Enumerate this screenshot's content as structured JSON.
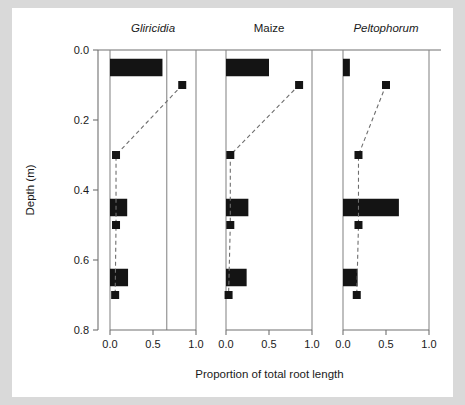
{
  "figure": {
    "background_color": "#d9d9d9",
    "canvas_color": "#ffffff",
    "axis_color": "#707070",
    "data_color": "#141414"
  },
  "axes": {
    "y_title": "Depth (m)",
    "x_title": "Proportion of total root length",
    "y_ticks": [
      "0.0",
      "0.2",
      "0.4",
      "0.6",
      "0.8"
    ],
    "y_tick_values": [
      0.0,
      0.2,
      0.4,
      0.6,
      0.8
    ],
    "x_ticks": [
      "0.0",
      "0.5",
      "1.0"
    ],
    "x_tick_values": [
      0.0,
      0.5,
      1.0
    ],
    "y_limits": [
      0.0,
      0.8
    ],
    "x_limits": [
      0.0,
      1.0
    ],
    "y_inverted": true
  },
  "chart_data": {
    "type": "bar",
    "title": "",
    "subtitle": "",
    "xlabel": "Proportion of total root length",
    "ylabel": "Depth (m)",
    "xlim": [
      0.0,
      1.0
    ],
    "ylim": [
      0.0,
      0.8
    ],
    "y_inverted": true,
    "grid": false,
    "legend": "none",
    "orientation": "horizontal",
    "panel_layout": "1x3",
    "categories": [
      0.05,
      0.1,
      0.3,
      0.45,
      0.5,
      0.65,
      0.7
    ],
    "panels": [
      {
        "title": "Gliricidia",
        "title_style": "italic",
        "bars": [
          {
            "depth": 0.05,
            "value": 0.61,
            "height_m": 0.05
          },
          {
            "depth": 0.45,
            "value": 0.2,
            "height_m": 0.05
          },
          {
            "depth": 0.65,
            "value": 0.21,
            "height_m": 0.05
          }
        ],
        "line_series": {
          "name": "cumulative proportion",
          "style": "dashed-with-square-markers",
          "points": [
            {
              "depth": 0.1,
              "value": 0.84
            },
            {
              "depth": 0.3,
              "value": 0.07
            },
            {
              "depth": 0.5,
              "value": 0.07
            },
            {
              "depth": 0.7,
              "value": 0.06
            }
          ]
        },
        "reference_line_value": 0.66
      },
      {
        "title": "Maize",
        "title_style": "normal",
        "bars": [
          {
            "depth": 0.05,
            "value": 0.5,
            "height_m": 0.05
          },
          {
            "depth": 0.45,
            "value": 0.26,
            "height_m": 0.05
          },
          {
            "depth": 0.65,
            "value": 0.24,
            "height_m": 0.05
          }
        ],
        "line_series": {
          "name": "cumulative proportion",
          "style": "dashed-with-square-markers",
          "points": [
            {
              "depth": 0.1,
              "value": 0.85
            },
            {
              "depth": 0.3,
              "value": 0.05
            },
            {
              "depth": 0.5,
              "value": 0.05
            },
            {
              "depth": 0.7,
              "value": 0.03
            }
          ]
        },
        "reference_line_value": null
      },
      {
        "title": "Peltophorum",
        "title_style": "italic",
        "bars": [
          {
            "depth": 0.05,
            "value": 0.08,
            "height_m": 0.05
          },
          {
            "depth": 0.45,
            "value": 0.65,
            "height_m": 0.05
          },
          {
            "depth": 0.65,
            "value": 0.17,
            "height_m": 0.05
          }
        ],
        "line_series": {
          "name": "cumulative proportion",
          "style": "dashed-with-square-markers",
          "points": [
            {
              "depth": 0.1,
              "value": 0.5
            },
            {
              "depth": 0.3,
              "value": 0.18
            },
            {
              "depth": 0.5,
              "value": 0.18
            },
            {
              "depth": 0.7,
              "value": 0.16
            }
          ]
        },
        "reference_line_value": null
      }
    ]
  }
}
